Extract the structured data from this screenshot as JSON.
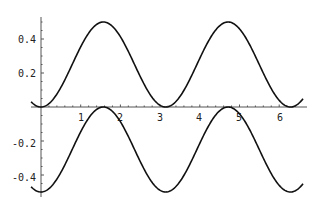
{
  "chart_data": {
    "type": "line",
    "title": "",
    "xlabel": "",
    "ylabel": "",
    "xlim": [
      -0.25,
      6.6
    ],
    "ylim": [
      -0.52,
      0.53
    ],
    "grid": false,
    "legend": null,
    "x_ticks": [
      1,
      2,
      3,
      4,
      5,
      6
    ],
    "x_tick_labels": [
      "1",
      "2",
      "3",
      "4",
      "5",
      "6"
    ],
    "y_ticks": [
      -0.4,
      -0.2,
      0.2,
      0.4
    ],
    "y_tick_labels": [
      "-0.4",
      "-0.2",
      "0.2",
      "0.4"
    ],
    "series": [
      {
        "name": "sin^2(x)/2",
        "formula": "0.5*sin(x)^2",
        "x": [
          -0.25,
          0,
          0.5,
          1.0,
          1.5708,
          2.0,
          2.5,
          3.1416,
          3.5,
          4.0,
          4.7124,
          5.0,
          5.5,
          6.2832,
          6.6
        ],
        "values": [
          0.03,
          0.0,
          0.115,
          0.354,
          0.5,
          0.413,
          0.179,
          0.0,
          0.062,
          0.286,
          0.5,
          0.46,
          0.25,
          0.0,
          0.05
        ]
      },
      {
        "name": "-cos^2(x)/2",
        "formula": "-0.5*cos(x)^2",
        "x": [
          -0.25,
          0,
          0.5,
          1.0,
          1.5708,
          2.0,
          2.5,
          3.1416,
          3.5,
          4.0,
          4.7124,
          5.0,
          5.5,
          6.2832,
          6.6
        ],
        "values": [
          -0.47,
          -0.5,
          -0.385,
          -0.146,
          0.0,
          -0.087,
          -0.321,
          -0.5,
          -0.438,
          -0.214,
          0.0,
          -0.04,
          -0.25,
          -0.5,
          -0.45
        ]
      }
    ]
  },
  "axes": {
    "x_labels": [
      "1",
      "2",
      "3",
      "4",
      "5",
      "6"
    ],
    "y_labels": [
      "0.4",
      "0.2",
      "-0.2",
      "-0.4"
    ]
  }
}
